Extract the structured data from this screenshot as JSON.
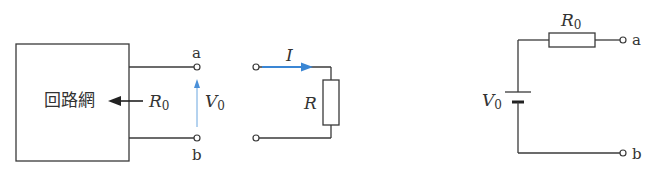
{
  "figure": {
    "network_box": {
      "label": "回路網"
    },
    "thevenin_resistance": {
      "symbol": "R",
      "subscript": "0"
    },
    "open_voltage": {
      "symbol": "V",
      "subscript": "0",
      "arrow_color": "#4a90d9"
    },
    "terminals": {
      "a": "a",
      "b": "b"
    },
    "load": {
      "current": {
        "symbol": "I",
        "arrow_color": "#3a86d4"
      },
      "resistor": {
        "symbol": "R"
      }
    },
    "equivalent_circuit": {
      "resistor": {
        "symbol": "R",
        "subscript": "0"
      },
      "source": {
        "symbol": "V",
        "subscript": "0"
      },
      "terminal_a": "a",
      "terminal_b": "b"
    }
  }
}
